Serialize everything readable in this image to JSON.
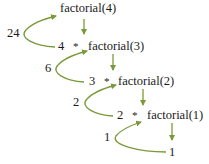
{
  "diagram": {
    "arrow_color": "#7a9a3a",
    "text_color": "#1a1a1a",
    "calls": [
      {
        "multiplier": "",
        "operator": "",
        "call": "factorial(4)"
      },
      {
        "multiplier": "4",
        "operator": "*",
        "call": "factorial(3)"
      },
      {
        "multiplier": "3",
        "operator": "*",
        "call": "factorial(2)"
      },
      {
        "multiplier": "2",
        "operator": "*",
        "call": "factorial(1)"
      },
      {
        "multiplier": "",
        "operator": "",
        "call": "1"
      }
    ],
    "return_values": [
      "24",
      "6",
      "2",
      "1"
    ]
  }
}
